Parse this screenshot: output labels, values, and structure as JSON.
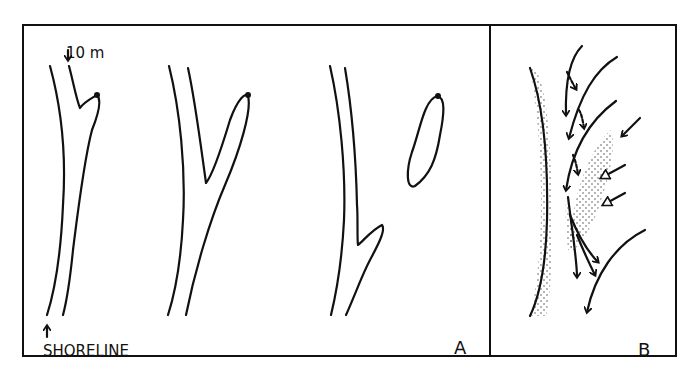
{
  "figure": {
    "panel_a": {
      "letter": "A",
      "scale_label": "10 m",
      "shoreline_label": "SHORELINE",
      "stages": [
        "stage-1-attached-spit",
        "stage-2-elongated-spit",
        "stage-3-detached-bar"
      ]
    },
    "panel_b": {
      "letter": "B",
      "elements": [
        "stippled-sand-shore",
        "stippled-sand-bar",
        "flow-arrows",
        "open-arrowheads"
      ]
    },
    "colors": {
      "ink": "#111111",
      "background": "#ffffff",
      "stipple": "#333333"
    }
  }
}
